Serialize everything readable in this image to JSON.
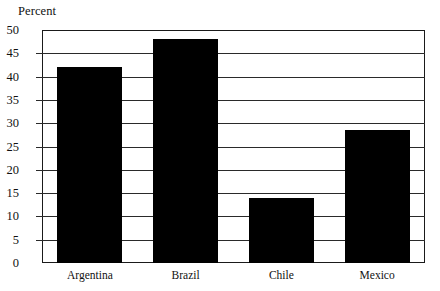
{
  "chart_data": {
    "type": "bar",
    "title": "",
    "xlabel": "",
    "ylabel": "Percent",
    "categories": [
      "Argentina",
      "Brazil",
      "Chile",
      "Mexico"
    ],
    "values": [
      42,
      48,
      14,
      28.5
    ],
    "ylim": [
      0,
      50
    ],
    "ytick_step": 5,
    "yticks": [
      0,
      5,
      10,
      15,
      20,
      25,
      30,
      35,
      40,
      45,
      50
    ],
    "ytick_labels": [
      "0",
      "5",
      "10",
      "15",
      "20",
      "25",
      "30",
      "35",
      "40",
      "45",
      "50"
    ],
    "grid": true,
    "grid_axis": "y",
    "legend": false,
    "bar_color": "#000000",
    "axis_color": "#1a1a1a",
    "background_color": "#ffffff"
  }
}
